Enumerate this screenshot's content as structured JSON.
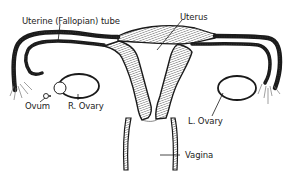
{
  "diagram": {
    "type": "anatomical-line-drawing",
    "labels": {
      "uterine_tube": "Uterine (Fallopian) tube",
      "uterus": "Uterus",
      "ovum": "Ovum",
      "right_ovary": "R. Ovary",
      "left_ovary": "L. Ovary",
      "vagina": "Vagina"
    },
    "colors": {
      "line": "#1a1a1a",
      "hatch": "#555555",
      "background": "#ffffff"
    }
  }
}
